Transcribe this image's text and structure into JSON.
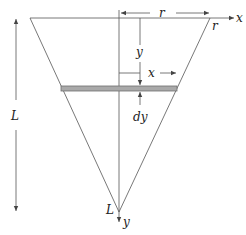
{
  "diagram": {
    "labels": {
      "r_top": "r",
      "r_corner": "r",
      "x_axis": "x",
      "y_distance": "y",
      "x_distance": "x",
      "dy": "dy",
      "L_height": "L",
      "L_apex": "L",
      "y_axis": "y"
    },
    "colors": {
      "line": "#555555",
      "strip_fill": "#a9a9a9",
      "strip_stroke": "#6e6e6e",
      "text": "#222222"
    }
  }
}
